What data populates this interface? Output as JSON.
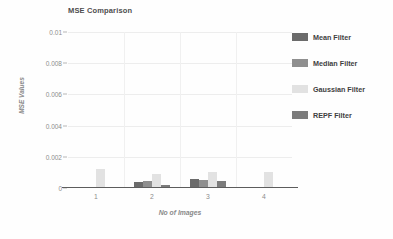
{
  "chart_data": {
    "type": "bar",
    "title": "MSE Comparison",
    "xlabel": "No of Images",
    "ylabel": "MSE Values",
    "categories": [
      "1",
      "2",
      "3",
      "4"
    ],
    "ylim": [
      0,
      0.01
    ],
    "yticks": [
      "0",
      "0.002",
      "0.004",
      "0.006",
      "0.008",
      "0.01"
    ],
    "ytick_values": [
      0,
      0.002,
      0.004,
      0.006,
      0.008,
      0.01
    ],
    "grid": true,
    "legend_position": "right",
    "series": [
      {
        "name": "Mean Filter",
        "color": "#6b6b6b",
        "values": [
          8e-05,
          0.00036,
          0.00055,
          9e-05
        ]
      },
      {
        "name": "Median Filter",
        "color": "#8f8f8f",
        "values": [
          6e-05,
          0.00045,
          0.0005,
          8e-05
        ]
      },
      {
        "name": "Gaussian Filter",
        "color": "#e2e2e2",
        "values": [
          0.0012,
          0.0009,
          0.00105,
          0.00102
        ]
      },
      {
        "name": "REPF Filter",
        "color": "#7c7c7c",
        "values": [
          7e-05,
          0.0002,
          0.00046,
          6e-05
        ]
      }
    ]
  },
  "legend": {
    "items": [
      {
        "label": "Mean Filter",
        "color": "#6b6b6b"
      },
      {
        "label": "Median Filter",
        "color": "#8f8f8f"
      },
      {
        "label": "Gaussian Filter",
        "color": "#e2e2e2"
      },
      {
        "label": "REPF Filter",
        "color": "#7c7c7c"
      }
    ]
  }
}
